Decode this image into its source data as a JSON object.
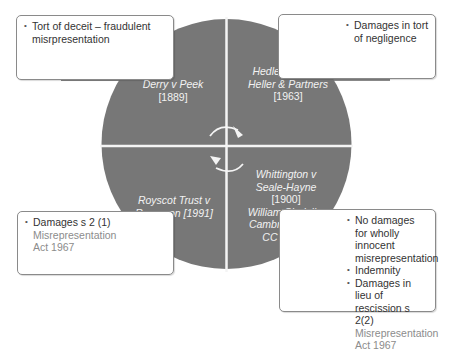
{
  "colors": {
    "circle_fill": "#777777",
    "divider": "#f4f4f4",
    "box_border": "#8a8a8a",
    "body_text": "#333333",
    "act_text": "#8c8c8c",
    "quadrant_text": "#f2f2f2"
  },
  "quadrants": {
    "top_left": {
      "case": "Derry v Peek",
      "year": "[1889]"
    },
    "top_right": {
      "case_line1": "Hedley Byrne v",
      "case_line2": "Heller & Partners",
      "year": "[1963]"
    },
    "bottom_left": {
      "case_line1": "Royscot Trust v",
      "case_line2": "Rogerson [1991]"
    },
    "bottom_right": {
      "case1_line1": "Whittington v",
      "case1_line2": "Seale-Hayne",
      "case1_year": "[1900]",
      "case2_line1": "William Sindall v",
      "case2_line2": "Cambridgeshire",
      "case2_line3": "CC [1994]"
    }
  },
  "boxes": {
    "top_left": {
      "bullets": [
        "Tort of deceit – fraudulent misrpresentation"
      ]
    },
    "top_right": {
      "bullets": [
        "Damages in tort of negligence"
      ]
    },
    "bottom_left": {
      "bullet": "Damages s 2 (1)",
      "act": "Misrepresentation Act 1967"
    },
    "bottom_right": {
      "bullets": [
        "No damages for wholly innocent misrepresentation",
        "Indemnity",
        "Damages in lieu of rescission s 2(2)"
      ],
      "act": "Misrepresentation Act 1967"
    }
  },
  "icons": {
    "center": "cycle-arrows-icon"
  }
}
